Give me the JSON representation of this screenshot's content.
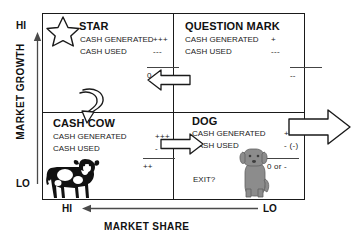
{
  "diagram": {
    "axes": {
      "y": {
        "label": "MARKET GROWTH",
        "high": "HI",
        "low": "LO"
      },
      "x": {
        "label": "MARKET SHARE",
        "high": "HI",
        "low": "LO"
      }
    },
    "quadrants": [
      {
        "key": "star",
        "title": "STAR",
        "icon": "star-icon",
        "rows": [
          {
            "label": "CASH GENERATED",
            "value": "+++"
          },
          {
            "label": "CASH USED",
            "value": "---"
          }
        ],
        "net": "0 or -"
      },
      {
        "key": "question_mark",
        "title": "QUESTION MARK",
        "icon": "",
        "rows": [
          {
            "label": "CASH GENERATED",
            "value": "+"
          },
          {
            "label": "CASH USED",
            "value": "---"
          }
        ],
        "net": "--"
      },
      {
        "key": "cash_cow",
        "title": "CASH COW",
        "icon": "cow-icon",
        "rows": [
          {
            "label": "CASH GENERATED",
            "value": "+++"
          },
          {
            "label": "CASH USED",
            "value": "-"
          }
        ],
        "net": "++"
      },
      {
        "key": "dog",
        "title": "DOG",
        "icon": "dog-icon",
        "rows": [
          {
            "label": "CASH GENERATED",
            "value": "+"
          },
          {
            "label": "CASH USED",
            "value": "- (-)"
          }
        ],
        "net": "0 or -",
        "exit_label": "EXIT?"
      }
    ],
    "flows": [
      {
        "key": "question-mark-to-star",
        "direction": "left"
      },
      {
        "key": "star-to-cash-cow",
        "direction": "curve-down"
      },
      {
        "key": "cash-cow-to-dog",
        "direction": "right"
      },
      {
        "key": "dog-exit",
        "direction": "right"
      }
    ],
    "colors": {
      "line": "#1a1a1a",
      "text": "#111111",
      "dog_fill": "#8c8c8c",
      "cow_fill": "#111111",
      "background": "#ffffff"
    }
  }
}
